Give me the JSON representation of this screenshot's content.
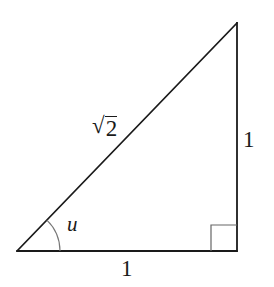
{
  "diagram": {
    "type": "right-triangle",
    "vertices": {
      "angle_vertex": [
        17,
        251
      ],
      "right_angle_vertex": [
        237,
        251
      ],
      "top_vertex": [
        237,
        23
      ]
    },
    "labels": {
      "hypotenuse": {
        "radical_symbol": "√",
        "radicand": "2"
      },
      "vertical_leg": "1",
      "horizontal_leg": "1",
      "angle": "u"
    },
    "right_angle_marker": true,
    "colors": {
      "stroke": "#1a1a1a",
      "arc": "#777777",
      "right_angle_square": "#666666",
      "background": "#ffffff"
    }
  }
}
